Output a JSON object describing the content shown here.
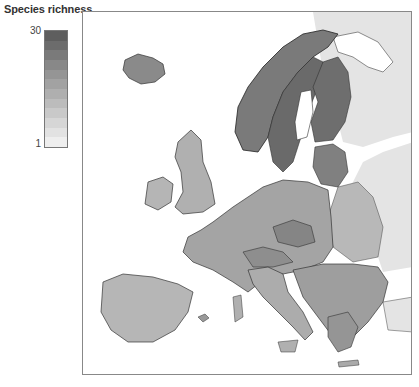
{
  "legend": {
    "title": "Species richness",
    "max_label": "30",
    "min_label": "1",
    "steps": [
      "#5e5e5e",
      "#6c6c6c",
      "#7a7a7a",
      "#888888",
      "#959595",
      "#a2a2a2",
      "#afafaf",
      "#bcbcbc",
      "#c9c9c9",
      "#d6d6d6",
      "#e2e2e2",
      "#eeeeee"
    ]
  },
  "map": {
    "region": "Europe",
    "variable": "Species richness",
    "range": [
      1,
      30
    ],
    "no_data_color": "#e6e6e6",
    "sea_color": "#ffffff",
    "border_color": "#333333"
  }
}
